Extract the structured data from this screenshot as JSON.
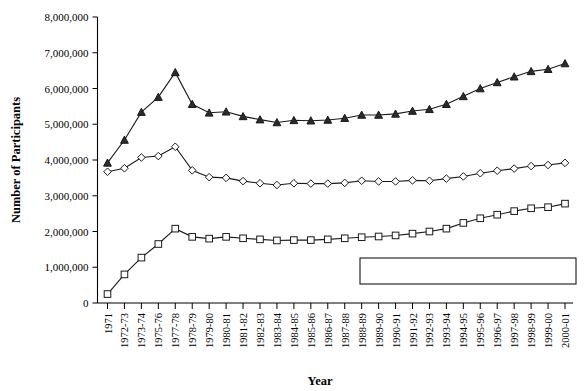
{
  "chart_data": {
    "type": "line",
    "title": "",
    "xlabel": "Year",
    "ylabel": "Number of Participants",
    "ylim": [
      0,
      8000000
    ],
    "ytick_labels": [
      "0",
      "1,000,000",
      "2,000,000",
      "3,000,000",
      "4,000,000",
      "5,000,000",
      "6,000,000",
      "7,000,000",
      "8,000,000"
    ],
    "ytick_values": [
      0,
      1000000,
      2000000,
      3000000,
      4000000,
      5000000,
      6000000,
      7000000,
      8000000
    ],
    "grid": false,
    "legend_position": "lower-right",
    "categories": [
      "1971",
      "1972-73",
      "1973-74",
      "1975-76",
      "1977-78",
      "1978-79",
      "1979-80",
      "1980-81",
      "1981-82",
      "1982-83",
      "1983-84",
      "1984-85",
      "1985-86",
      "1986-87",
      "1987-88",
      "1988-89",
      "1989-90",
      "1990-91",
      "1991-92",
      "1992-93",
      "1993-94",
      "1994-95",
      "1995-96",
      "1996-97",
      "1997-98",
      "1998-99",
      "1999-00",
      "2000-01"
    ],
    "series": [
      {
        "name": "Boys",
        "marker": "diamond-open",
        "values": [
          3670000,
          3770000,
          4070000,
          4110000,
          4370000,
          3710000,
          3520000,
          3500000,
          3410000,
          3350000,
          3300000,
          3350000,
          3340000,
          3340000,
          3360000,
          3420000,
          3400000,
          3400000,
          3430000,
          3420000,
          3480000,
          3540000,
          3630000,
          3700000,
          3760000,
          3830000,
          3860000,
          3920000
        ]
      },
      {
        "name": "Girls",
        "marker": "square-open",
        "values": [
          250000,
          800000,
          1270000,
          1650000,
          2080000,
          1850000,
          1800000,
          1850000,
          1810000,
          1780000,
          1750000,
          1760000,
          1760000,
          1780000,
          1810000,
          1840000,
          1860000,
          1890000,
          1940000,
          2000000,
          2080000,
          2240000,
          2370000,
          2470000,
          2570000,
          2650000,
          2680000,
          2780000
        ]
      },
      {
        "name": "Total",
        "marker": "triangle-solid",
        "values": [
          3920000,
          4560000,
          5340000,
          5760000,
          6450000,
          5560000,
          5320000,
          5350000,
          5220000,
          5130000,
          5050000,
          5110000,
          5100000,
          5120000,
          5170000,
          5260000,
          5260000,
          5290000,
          5370000,
          5420000,
          5560000,
          5780000,
          6000000,
          6170000,
          6330000,
          6480000,
          6540000,
          6700000
        ]
      }
    ]
  },
  "legend": {
    "entries": [
      {
        "label": "Boys",
        "marker": "diamond-open"
      },
      {
        "label": "Girls",
        "marker": "square-open"
      },
      {
        "label": "Total",
        "marker": "triangle-solid"
      }
    ]
  }
}
